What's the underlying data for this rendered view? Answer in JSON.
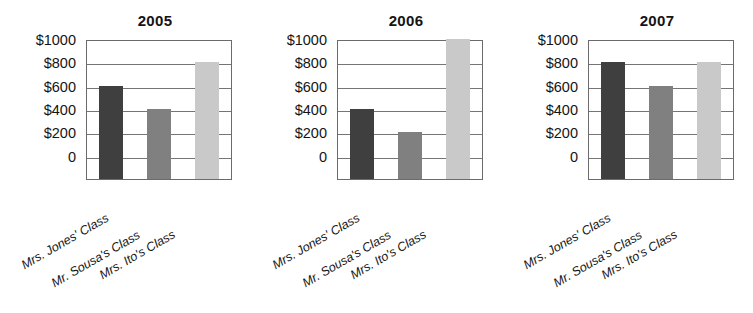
{
  "figure": {
    "type": "grouped-bar-charts",
    "panel_count": 3,
    "currency_prefix": "$"
  },
  "axis": {
    "y_ticks": [
      "$1000",
      "$800",
      "$600",
      "$400",
      "$200",
      "0"
    ],
    "y_values": [
      1000,
      800,
      600,
      400,
      200,
      0
    ],
    "ylim": [
      0,
      1000
    ],
    "grid": true
  },
  "categories": [
    "Mrs. Jones' Class",
    "Mr. Sousa's Class",
    "Mrs. Ito's Class"
  ],
  "colors": {
    "bar_dark": "#3f3f3f",
    "bar_medium": "#808080",
    "bar_light": "#c9c9c9",
    "gridline": "#757575",
    "axis": "#6b6b6b",
    "text": "#141414",
    "background": "#ffffff"
  },
  "panels": [
    {
      "title": "2005",
      "values": [
        600,
        400,
        800
      ],
      "labels": [
        "Mrs. Jones' Class",
        "Mr. Sousa's Class",
        "Mrs. Ito's Class"
      ]
    },
    {
      "title": "2006",
      "values": [
        400,
        200,
        1000
      ],
      "labels": [
        "Mrs. Jones' Class",
        "Mr. Sousa's Class",
        "Mrs. Ito's Class"
      ]
    },
    {
      "title": "2007",
      "values": [
        800,
        600,
        800
      ],
      "labels": [
        "Mrs. Jones' Class",
        "Mr. Sousa's Class",
        "Mrs. Ito's Class"
      ]
    }
  ],
  "chart_data": [
    {
      "type": "bar",
      "title": "2005",
      "categories": [
        "Mrs. Jones' Class",
        "Mr. Sousa's Class",
        "Mrs. Ito's Class"
      ],
      "values": [
        600,
        400,
        800
      ],
      "xlabel": "",
      "ylabel": "",
      "ylim": [
        0,
        1000
      ],
      "yticks": [
        0,
        200,
        400,
        600,
        800,
        1000
      ],
      "ytick_labels": [
        "0",
        "$200",
        "$400",
        "$600",
        "$800",
        "$1000"
      ],
      "grid": true,
      "legend": "none",
      "bar_colors": [
        "#3f3f3f",
        "#808080",
        "#c9c9c9"
      ]
    },
    {
      "type": "bar",
      "title": "2006",
      "categories": [
        "Mrs. Jones' Class",
        "Mr. Sousa's Class",
        "Mrs. Ito's Class"
      ],
      "values": [
        400,
        200,
        1000
      ],
      "xlabel": "",
      "ylabel": "",
      "ylim": [
        0,
        1000
      ],
      "yticks": [
        0,
        200,
        400,
        600,
        800,
        1000
      ],
      "ytick_labels": [
        "0",
        "$200",
        "$400",
        "$600",
        "$800",
        "$1000"
      ],
      "grid": true,
      "legend": "none",
      "bar_colors": [
        "#3f3f3f",
        "#808080",
        "#c9c9c9"
      ]
    },
    {
      "type": "bar",
      "title": "2007",
      "categories": [
        "Mrs. Jones' Class",
        "Mr. Sousa's Class",
        "Mrs. Ito's Class"
      ],
      "values": [
        800,
        600,
        800
      ],
      "xlabel": "",
      "ylabel": "",
      "ylim": [
        0,
        1000
      ],
      "yticks": [
        0,
        200,
        400,
        600,
        800,
        1000
      ],
      "ytick_labels": [
        "0",
        "$200",
        "$400",
        "$600",
        "$800",
        "$1000"
      ],
      "grid": true,
      "legend": "none",
      "bar_colors": [
        "#3f3f3f",
        "#808080",
        "#c9c9c9"
      ]
    }
  ]
}
